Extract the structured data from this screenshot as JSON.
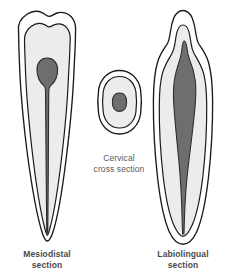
{
  "figure": {
    "background_color": "#ffffff"
  },
  "colors": {
    "outline": "#1a1a1a",
    "enamel": "#ffffff",
    "dentin": "#ececec",
    "pulp": "#6e6e6e",
    "pulp_outline": "#2b2b2b",
    "label_text": "#4a4a4a"
  },
  "panels": {
    "left": {
      "name": "mesiodistal-section",
      "caption_line1": "Mesiodistal",
      "caption_line2": "section",
      "layers": [
        "enamel",
        "dentin",
        "pulp"
      ]
    },
    "center": {
      "name": "cervical-cross-section",
      "caption_line1": "Cervical",
      "caption_line2": "cross section",
      "layers": [
        "cementum",
        "dentin",
        "pulp"
      ]
    },
    "right": {
      "name": "labiolingual-section",
      "caption_line1": "Labiolingual",
      "caption_line2": "section",
      "layers": [
        "enamel",
        "dentin",
        "pulp"
      ]
    }
  }
}
